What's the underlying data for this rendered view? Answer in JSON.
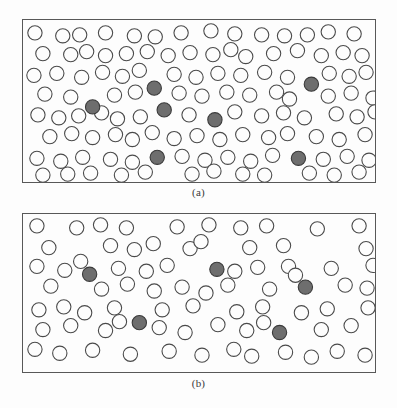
{
  "figure": {
    "type": "scientific-illustration",
    "background_color": "#fdfdfd",
    "border_color": "#585858",
    "open_circle_fill": "#fdfdfd",
    "open_circle_stroke": "#4a4a4a",
    "shaded_circle_fill": "#6e6e6e",
    "shaded_circle_stroke": "#3a3a3a",
    "circle_radius": 7.2
  },
  "panels": [
    {
      "id": "panel-a",
      "caption": "(a)",
      "box": {
        "x": 22,
        "y": 19,
        "width": 354,
        "height": 164
      },
      "counts": {
        "open": 91,
        "shaded": 7,
        "total": 98
      },
      "shaded_circles": [
        {
          "cx": 132,
          "cy": 69
        },
        {
          "cx": 290,
          "cy": 65
        },
        {
          "cx": 70,
          "cy": 88
        },
        {
          "cx": 142,
          "cy": 91
        },
        {
          "cx": 193,
          "cy": 101
        },
        {
          "cx": 135,
          "cy": 139
        },
        {
          "cx": 277,
          "cy": 140
        }
      ],
      "open_circles": [
        {
          "cx": 12,
          "cy": 13
        },
        {
          "cx": 40,
          "cy": 16
        },
        {
          "cx": 57,
          "cy": 15
        },
        {
          "cx": 83,
          "cy": 13
        },
        {
          "cx": 112,
          "cy": 16
        },
        {
          "cx": 133,
          "cy": 17
        },
        {
          "cx": 159,
          "cy": 13
        },
        {
          "cx": 189,
          "cy": 11
        },
        {
          "cx": 213,
          "cy": 14
        },
        {
          "cx": 240,
          "cy": 15
        },
        {
          "cx": 263,
          "cy": 16
        },
        {
          "cx": 286,
          "cy": 15
        },
        {
          "cx": 307,
          "cy": 12
        },
        {
          "cx": 333,
          "cy": 14
        },
        {
          "cx": 20,
          "cy": 34
        },
        {
          "cx": 48,
          "cy": 35
        },
        {
          "cx": 64,
          "cy": 32
        },
        {
          "cx": 83,
          "cy": 36
        },
        {
          "cx": 104,
          "cy": 34
        },
        {
          "cx": 125,
          "cy": 32
        },
        {
          "cx": 146,
          "cy": 36
        },
        {
          "cx": 168,
          "cy": 33
        },
        {
          "cx": 191,
          "cy": 35
        },
        {
          "cx": 209,
          "cy": 30
        },
        {
          "cx": 224,
          "cy": 37
        },
        {
          "cx": 252,
          "cy": 34
        },
        {
          "cx": 276,
          "cy": 31
        },
        {
          "cx": 300,
          "cy": 36
        },
        {
          "cx": 322,
          "cy": 33
        },
        {
          "cx": 341,
          "cy": 36
        },
        {
          "cx": 11,
          "cy": 56
        },
        {
          "cx": 34,
          "cy": 54
        },
        {
          "cx": 59,
          "cy": 58
        },
        {
          "cx": 80,
          "cy": 53
        },
        {
          "cx": 100,
          "cy": 57
        },
        {
          "cx": 117,
          "cy": 51
        },
        {
          "cx": 152,
          "cy": 55
        },
        {
          "cx": 174,
          "cy": 58
        },
        {
          "cx": 196,
          "cy": 54
        },
        {
          "cx": 219,
          "cy": 56
        },
        {
          "cx": 243,
          "cy": 53
        },
        {
          "cx": 266,
          "cy": 58
        },
        {
          "cx": 308,
          "cy": 54
        },
        {
          "cx": 328,
          "cy": 57
        },
        {
          "cx": 345,
          "cy": 53
        },
        {
          "cx": 22,
          "cy": 75
        },
        {
          "cx": 48,
          "cy": 78
        },
        {
          "cx": 92,
          "cy": 76
        },
        {
          "cx": 113,
          "cy": 73
        },
        {
          "cx": 157,
          "cy": 74
        },
        {
          "cx": 180,
          "cy": 77
        },
        {
          "cx": 205,
          "cy": 73
        },
        {
          "cx": 228,
          "cy": 76
        },
        {
          "cx": 255,
          "cy": 73
        },
        {
          "cx": 268,
          "cy": 80
        },
        {
          "cx": 307,
          "cy": 77
        },
        {
          "cx": 330,
          "cy": 74
        },
        {
          "cx": 352,
          "cy": 79
        },
        {
          "cx": 15,
          "cy": 96
        },
        {
          "cx": 36,
          "cy": 99
        },
        {
          "cx": 56,
          "cy": 97
        },
        {
          "cx": 79,
          "cy": 94
        },
        {
          "cx": 95,
          "cy": 100
        },
        {
          "cx": 118,
          "cy": 98
        },
        {
          "cx": 167,
          "cy": 96
        },
        {
          "cx": 213,
          "cy": 93
        },
        {
          "cx": 240,
          "cy": 97
        },
        {
          "cx": 262,
          "cy": 94
        },
        {
          "cx": 283,
          "cy": 99
        },
        {
          "cx": 315,
          "cy": 95
        },
        {
          "cx": 336,
          "cy": 98
        },
        {
          "cx": 354,
          "cy": 93
        },
        {
          "cx": 27,
          "cy": 118
        },
        {
          "cx": 49,
          "cy": 115
        },
        {
          "cx": 70,
          "cy": 119
        },
        {
          "cx": 93,
          "cy": 116
        },
        {
          "cx": 110,
          "cy": 121
        },
        {
          "cx": 130,
          "cy": 114
        },
        {
          "cx": 152,
          "cy": 120
        },
        {
          "cx": 175,
          "cy": 117
        },
        {
          "cx": 198,
          "cy": 121
        },
        {
          "cx": 221,
          "cy": 116
        },
        {
          "cx": 247,
          "cy": 119
        },
        {
          "cx": 266,
          "cy": 115
        },
        {
          "cx": 295,
          "cy": 118
        },
        {
          "cx": 318,
          "cy": 121
        },
        {
          "cx": 344,
          "cy": 116
        },
        {
          "cx": 14,
          "cy": 140
        },
        {
          "cx": 38,
          "cy": 143
        },
        {
          "cx": 60,
          "cy": 139
        },
        {
          "cx": 88,
          "cy": 141
        },
        {
          "cx": 110,
          "cy": 144
        },
        {
          "cx": 160,
          "cy": 138
        },
        {
          "cx": 183,
          "cy": 142
        },
        {
          "cx": 206,
          "cy": 139
        },
        {
          "cx": 229,
          "cy": 143
        },
        {
          "cx": 251,
          "cy": 137
        },
        {
          "cx": 302,
          "cy": 141
        },
        {
          "cx": 326,
          "cy": 138
        },
        {
          "cx": 348,
          "cy": 142
        },
        {
          "cx": 20,
          "cy": 157
        },
        {
          "cx": 45,
          "cy": 156
        },
        {
          "cx": 68,
          "cy": 155
        },
        {
          "cx": 99,
          "cy": 157
        },
        {
          "cx": 123,
          "cy": 154
        },
        {
          "cx": 170,
          "cy": 156
        },
        {
          "cx": 192,
          "cy": 153
        },
        {
          "cx": 221,
          "cy": 156
        },
        {
          "cx": 243,
          "cy": 157
        },
        {
          "cx": 288,
          "cy": 155
        },
        {
          "cx": 313,
          "cy": 157
        },
        {
          "cx": 338,
          "cy": 154
        }
      ]
    },
    {
      "id": "panel-b",
      "caption": "(b)",
      "box": {
        "x": 22,
        "y": 213,
        "width": 354,
        "height": 160
      },
      "counts": {
        "open": 76,
        "shaded": 5,
        "total": 81
      },
      "shaded_circles": [
        {
          "cx": 67,
          "cy": 61
        },
        {
          "cx": 195,
          "cy": 56
        },
        {
          "cx": 284,
          "cy": 74
        },
        {
          "cx": 117,
          "cy": 110
        },
        {
          "cx": 258,
          "cy": 120
        }
      ],
      "open_circles": [
        {
          "cx": 14,
          "cy": 12
        },
        {
          "cx": 54,
          "cy": 14
        },
        {
          "cx": 78,
          "cy": 11
        },
        {
          "cx": 104,
          "cy": 14
        },
        {
          "cx": 155,
          "cy": 13
        },
        {
          "cx": 187,
          "cy": 11
        },
        {
          "cx": 219,
          "cy": 14
        },
        {
          "cx": 245,
          "cy": 12
        },
        {
          "cx": 296,
          "cy": 15
        },
        {
          "cx": 338,
          "cy": 12
        },
        {
          "cx": 26,
          "cy": 34
        },
        {
          "cx": 88,
          "cy": 32
        },
        {
          "cx": 112,
          "cy": 36
        },
        {
          "cx": 131,
          "cy": 30
        },
        {
          "cx": 168,
          "cy": 35
        },
        {
          "cx": 179,
          "cy": 28
        },
        {
          "cx": 228,
          "cy": 34
        },
        {
          "cx": 262,
          "cy": 32
        },
        {
          "cx": 345,
          "cy": 35
        },
        {
          "cx": 14,
          "cy": 53
        },
        {
          "cx": 42,
          "cy": 57
        },
        {
          "cx": 58,
          "cy": 48
        },
        {
          "cx": 96,
          "cy": 55
        },
        {
          "cx": 124,
          "cy": 58
        },
        {
          "cx": 145,
          "cy": 52
        },
        {
          "cx": 213,
          "cy": 58
        },
        {
          "cx": 236,
          "cy": 54
        },
        {
          "cx": 267,
          "cy": 53
        },
        {
          "cx": 274,
          "cy": 62
        },
        {
          "cx": 310,
          "cy": 55
        },
        {
          "cx": 352,
          "cy": 52
        },
        {
          "cx": 28,
          "cy": 73
        },
        {
          "cx": 79,
          "cy": 76
        },
        {
          "cx": 105,
          "cy": 71
        },
        {
          "cx": 132,
          "cy": 78
        },
        {
          "cx": 160,
          "cy": 74
        },
        {
          "cx": 184,
          "cy": 80
        },
        {
          "cx": 206,
          "cy": 72
        },
        {
          "cx": 248,
          "cy": 76
        },
        {
          "cx": 324,
          "cy": 72
        },
        {
          "cx": 346,
          "cy": 75
        },
        {
          "cx": 16,
          "cy": 97
        },
        {
          "cx": 41,
          "cy": 94
        },
        {
          "cx": 62,
          "cy": 100
        },
        {
          "cx": 92,
          "cy": 95
        },
        {
          "cx": 140,
          "cy": 97
        },
        {
          "cx": 171,
          "cy": 93
        },
        {
          "cx": 215,
          "cy": 99
        },
        {
          "cx": 241,
          "cy": 94
        },
        {
          "cx": 280,
          "cy": 100
        },
        {
          "cx": 306,
          "cy": 96
        },
        {
          "cx": 347,
          "cy": 95
        },
        {
          "cx": 20,
          "cy": 117
        },
        {
          "cx": 48,
          "cy": 113
        },
        {
          "cx": 83,
          "cy": 118
        },
        {
          "cx": 97,
          "cy": 109
        },
        {
          "cx": 137,
          "cy": 115
        },
        {
          "cx": 163,
          "cy": 120
        },
        {
          "cx": 196,
          "cy": 112
        },
        {
          "cx": 225,
          "cy": 118
        },
        {
          "cx": 242,
          "cy": 110
        },
        {
          "cx": 300,
          "cy": 117
        },
        {
          "cx": 330,
          "cy": 113
        },
        {
          "cx": 12,
          "cy": 137
        },
        {
          "cx": 37,
          "cy": 141
        },
        {
          "cx": 70,
          "cy": 138
        },
        {
          "cx": 108,
          "cy": 142
        },
        {
          "cx": 147,
          "cy": 139
        },
        {
          "cx": 180,
          "cy": 143
        },
        {
          "cx": 212,
          "cy": 137
        },
        {
          "cx": 230,
          "cy": 144
        },
        {
          "cx": 264,
          "cy": 140
        },
        {
          "cx": 290,
          "cy": 145
        },
        {
          "cx": 316,
          "cy": 139
        },
        {
          "cx": 344,
          "cy": 143
        }
      ]
    }
  ]
}
